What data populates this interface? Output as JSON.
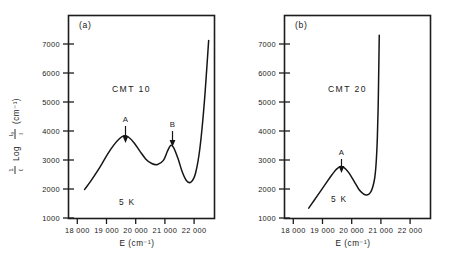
{
  "figure": {
    "axis_labels": {
      "x": "E (cm⁻¹)",
      "y_prefix": "1/ℓ Log I₀/I",
      "y_units": "(cm⁻¹)",
      "y_full": "1/ℓ Log I₀/I (cm⁻¹)"
    },
    "stroke_color": "#151515",
    "background_color": "#ffffff"
  },
  "chart_data": [
    {
      "type": "line",
      "panel": "(a)",
      "title": "CMT 10",
      "annotations": [
        {
          "label": "A",
          "x": 19600,
          "y": 3650
        },
        {
          "label": "B",
          "x": 21200,
          "y": 3340
        },
        {
          "label": "5 K",
          "x": 19750,
          "y": 2000
        }
      ],
      "xlabel": "E (cm⁻¹)",
      "ylabel": "1/ℓ Log I₀/I (cm⁻¹)",
      "xlim": [
        17700,
        22700
      ],
      "ylim": [
        1000,
        7500
      ],
      "xticks": [
        18000,
        19000,
        20000,
        21000,
        22000
      ],
      "xticklabels": [
        "18 000",
        "19 000",
        "20 000",
        "21 000",
        "22 000"
      ],
      "yticks": [
        1000,
        2000,
        3000,
        4000,
        5000,
        6000,
        7000
      ],
      "yticklabels": [
        "1000",
        "2000",
        "3000",
        "4000",
        "5000",
        "6000",
        "7000"
      ],
      "grid": false,
      "legend": null,
      "x": [
        18250,
        18450,
        18650,
        18850,
        19050,
        19250,
        19450,
        19600,
        19750,
        19950,
        20150,
        20350,
        20550,
        20750,
        20950,
        21100,
        21200,
        21300,
        21450,
        21600,
        21750,
        21900,
        22050,
        22200,
        22350,
        22500
      ],
      "values": [
        1930,
        2180,
        2460,
        2760,
        3080,
        3350,
        3560,
        3650,
        3610,
        3420,
        3150,
        2900,
        2760,
        2730,
        2860,
        3180,
        3340,
        3270,
        2920,
        2480,
        2200,
        2170,
        2450,
        3250,
        4700,
        6700
      ]
    },
    {
      "type": "line",
      "panel": "(b)",
      "title": "CMT 20",
      "annotations": [
        {
          "label": "A",
          "x": 19600,
          "y": 2660
        },
        {
          "label": "5 K",
          "x": 19650,
          "y": 1900
        }
      ],
      "xlabel": "E (cm⁻¹)",
      "ylabel": "1/ℓ Log I₀/I (cm⁻¹)",
      "xlim": [
        17700,
        22700
      ],
      "ylim": [
        1000,
        7500
      ],
      "xticks": [
        18000,
        19000,
        20000,
        21000,
        22000
      ],
      "xticklabels": [
        "18 000",
        "19 000",
        "20 000",
        "21 000",
        "22 000"
      ],
      "yticks": [
        1000,
        2000,
        3000,
        4000,
        5000,
        6000,
        7000
      ],
      "yticklabels": [
        "1000",
        "2000",
        "3000",
        "4000",
        "5000",
        "6000",
        "7000"
      ],
      "grid": false,
      "legend": null,
      "x": [
        18530,
        18700,
        18900,
        19100,
        19300,
        19470,
        19600,
        19750,
        19900,
        20080,
        20250,
        20400,
        20520,
        20640,
        20720,
        20790,
        20840,
        20880,
        20910,
        20930,
        20945
      ],
      "values": [
        1330,
        1560,
        1830,
        2100,
        2370,
        2570,
        2660,
        2620,
        2470,
        2200,
        1930,
        1790,
        1750,
        1830,
        2000,
        2300,
        2800,
        3600,
        4700,
        5900,
        6870
      ]
    }
  ]
}
